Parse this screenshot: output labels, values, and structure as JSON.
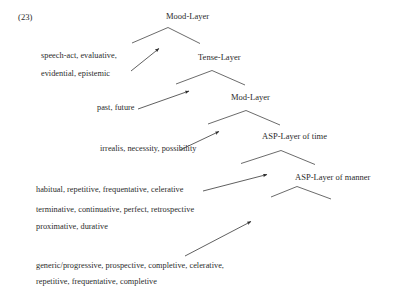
{
  "figure": {
    "example_number": "(23)",
    "kind": "functional-layer-tree"
  },
  "layers": [
    {
      "id": "mood",
      "label": "Mood-Layer"
    },
    {
      "id": "tense",
      "label": "Tense-Layer"
    },
    {
      "id": "mod",
      "label": "Mod-Layer"
    },
    {
      "id": "asp_time",
      "label": "ASP-Layer of time"
    },
    {
      "id": "asp_manner",
      "label": "ASP-Layer of manner"
    }
  ],
  "feature_lines": [
    {
      "id": "mood_1",
      "text": "speech-act, evaluative,"
    },
    {
      "id": "mood_2",
      "text": "evidential, epistemic"
    },
    {
      "id": "tense_1",
      "text": "past, future"
    },
    {
      "id": "mod_1",
      "text": "irrealis, necessity, possibility"
    },
    {
      "id": "time_1",
      "text": "habitual, repetitive, frequentative, celerative"
    },
    {
      "id": "time_2",
      "text": "terminative, continuative, perfect, retrospective"
    },
    {
      "id": "time_3",
      "text": "proximative, durative"
    },
    {
      "id": "manner_1",
      "text": "generic/progressive, prospective, completive, celerative,"
    },
    {
      "id": "manner_2",
      "text": "repetitive, frequentative, completive"
    }
  ],
  "colors": {
    "ink": "#2b2b2b",
    "line": "#3a3a3a",
    "background": "#ffffff"
  }
}
